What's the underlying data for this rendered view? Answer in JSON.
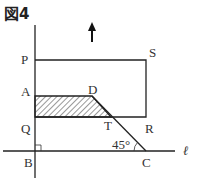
{
  "figure": {
    "title": "図4",
    "labels": {
      "P": "P",
      "S": "S",
      "A": "A",
      "D": "D",
      "Q": "Q",
      "T": "T",
      "R": "R",
      "B": "B",
      "C": "C",
      "line": "ℓ",
      "angle": "45°"
    },
    "arrow": "up",
    "colors": {
      "line": "#222222",
      "text": "#333333"
    }
  }
}
